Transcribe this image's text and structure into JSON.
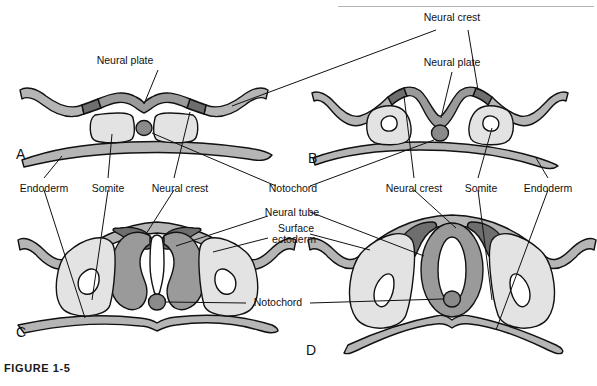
{
  "figure": {
    "caption": "FIGURE 1-5",
    "width": 597,
    "height": 386
  },
  "colors": {
    "neural_plate": "#9a9a9a",
    "neural_crest": "#6e6e6e",
    "ectoderm": "#b5b5b5",
    "somite": "#e3e3e3",
    "notochord": "#8a8a8a",
    "lumen": "#ffffff",
    "outline": "#111111",
    "background": "#ffffff",
    "rule": "#b4b4b4"
  },
  "panels": [
    {
      "id": "A",
      "letter": "A",
      "stage": "neural-plate",
      "description": "Flat neural plate with neural crest at edges, paired somites and notochord",
      "structures": [
        "neural plate",
        "neural crest",
        "somite",
        "notochord",
        "endoderm",
        "ectoderm"
      ]
    },
    {
      "id": "B",
      "letter": "B",
      "stage": "neural-groove-early",
      "description": "Neural plate invaginating into a groove, neural folds elevating",
      "structures": [
        "neural plate",
        "neural crest",
        "somite",
        "notochord",
        "endoderm"
      ]
    },
    {
      "id": "C",
      "letter": "C",
      "stage": "neural-groove-deep",
      "description": "Deep neural groove, neural folds approaching midline, neural crest at crests of folds",
      "structures": [
        "neural crest",
        "somite",
        "notochord",
        "endoderm",
        "surface ectoderm"
      ]
    },
    {
      "id": "D",
      "letter": "D",
      "stage": "neural-tube-closed",
      "description": "Closed neural tube separated from surface ectoderm, neural crest dorsolateral",
      "structures": [
        "neural tube",
        "neural crest",
        "somite",
        "notochord",
        "endoderm",
        "surface ectoderm"
      ]
    }
  ],
  "labels": {
    "a_neural_plate": "Neural plate",
    "b_neural_crest_top": "Neural crest",
    "b_neural_plate": "Neural plate",
    "row_endoderm_left": "Endoderm",
    "row_somite_left": "Somite",
    "row_neural_crest_left": "Neural crest",
    "row_notochord_center": "Notochord",
    "row_neural_crest_right": "Neural crest",
    "row_somite_right": "Somite",
    "row_endoderm_right": "Endoderm",
    "c_neural_tube": "Neural tube",
    "c_surface_ectoderm_line1": "Surface",
    "c_surface_ectoderm_line2": "ectoderm",
    "cd_notochord": "Notochord",
    "letter_a": "A",
    "letter_b": "B",
    "letter_c": "C",
    "letter_d": "D"
  }
}
